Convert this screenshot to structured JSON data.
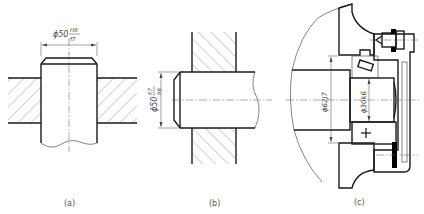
{
  "figure": {
    "panels": [
      {
        "id": "a",
        "caption": "(a)",
        "description": "Shaft through hole, clearance fit",
        "dimension": {
          "prefix": "ϕ50",
          "numerator": "H8",
          "denominator": "f7"
        }
      },
      {
        "id": "b",
        "caption": "(b)",
        "description": "Shaft in hole, transition fit",
        "dimension": {
          "prefix": "ϕ50",
          "numerator": "K7",
          "denominator": "h6"
        }
      },
      {
        "id": "c",
        "caption": "(c)",
        "description": "Bearing assembly with housing and end cap",
        "dimensions": [
          {
            "label": "ϕ62J7"
          },
          {
            "label": "ϕ30k6"
          }
        ]
      }
    ]
  }
}
